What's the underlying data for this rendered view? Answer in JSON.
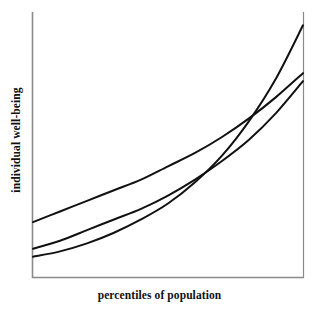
{
  "figure": {
    "background_color": "#ffffff",
    "axis_color": "#8a8a8a",
    "curve_color": "#111111"
  },
  "axes": {
    "xlabel": "percentiles of population",
    "ylabel": "individual well-being"
  },
  "chart_data": {
    "type": "line",
    "title": "",
    "subtitle": "",
    "xlabel": "percentiles of population",
    "ylabel": "individual well-being",
    "xlim": [
      0,
      100
    ],
    "ylim": [
      0,
      100
    ],
    "xticks": [],
    "yticks": [],
    "xticklabels": [],
    "yticklabels": [],
    "grid": false,
    "legend": false,
    "legend_position": "none",
    "annotations": [],
    "x": [
      0,
      10,
      20,
      30,
      40,
      50,
      60,
      70,
      80,
      90,
      100
    ],
    "series": [
      {
        "name": "flattest-curve",
        "values": [
          21,
          25,
          29,
          33,
          37,
          42,
          47,
          53,
          60,
          68,
          77
        ],
        "color": "#111111",
        "linewidth": 2
      },
      {
        "name": "middle-curve",
        "values": [
          11,
          14,
          18,
          22,
          26,
          31,
          37,
          44,
          52,
          62,
          74
        ],
        "color": "#111111",
        "linewidth": 2
      },
      {
        "name": "steepest-curve",
        "values": [
          8,
          10,
          13,
          17,
          22,
          28,
          36,
          46,
          59,
          75,
          95
        ],
        "color": "#111111",
        "linewidth": 2
      }
    ]
  }
}
